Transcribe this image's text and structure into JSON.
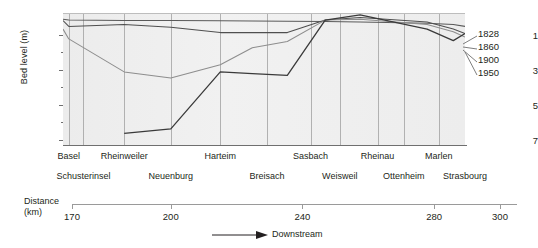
{
  "chart_data": {
    "type": "line",
    "title": "",
    "subtitle": "",
    "xlabel": "Distance (km)",
    "ylabel": "Bed level (m)",
    "y_ticks": [
      1,
      3,
      5,
      7
    ],
    "y_tick_labels": [
      "1",
      "3",
      "5",
      "7"
    ],
    "ylim": [
      0.2,
      7.6
    ],
    "y_inverted": true,
    "xlim": [
      163,
      301
    ],
    "x_ticks": [
      170,
      200,
      240,
      280,
      300
    ],
    "x_tick_labels": [
      "170",
      "200",
      "240",
      "280",
      "300"
    ],
    "grid": "vertical",
    "legend_position": "right",
    "direction_note": "Downstream",
    "series": [
      {
        "name": "1828",
        "color": "#5a5a5a",
        "x": [
          163,
          165,
          184,
          200,
          217,
          228,
          240,
          253,
          265,
          288,
          297,
          301
        ],
        "values": [
          0.55,
          0.6,
          0.62,
          0.62,
          0.64,
          0.65,
          0.66,
          0.68,
          0.7,
          0.78,
          0.85,
          0.95
        ]
      },
      {
        "name": "1860",
        "color": "#4f4f4f",
        "x": [
          163,
          165,
          184,
          200,
          217,
          228,
          240,
          253,
          265,
          288,
          297,
          301
        ],
        "values": [
          0.62,
          0.95,
          0.85,
          1.0,
          1.3,
          1.3,
          1.3,
          0.6,
          0.45,
          0.7,
          1.1,
          1.35
        ]
      },
      {
        "name": "1900",
        "color": "#8d8d8d",
        "x": [
          163,
          165,
          184,
          200,
          217,
          228,
          240,
          253,
          265,
          288,
          297,
          301
        ],
        "values": [
          1.1,
          1.65,
          3.5,
          3.85,
          3.1,
          2.15,
          1.8,
          0.6,
          0.55,
          0.85,
          1.25,
          1.55
        ]
      },
      {
        "name": "1950",
        "color": "#3a3a3a",
        "x": [
          184,
          200,
          217,
          228,
          240,
          253,
          265,
          288,
          297,
          301
        ],
        "values": [
          6.95,
          6.7,
          3.5,
          3.6,
          3.7,
          0.6,
          0.3,
          1.1,
          1.75,
          1.35
        ]
      }
    ],
    "places_upper": [
      {
        "label": "Basel",
        "x": 165
      },
      {
        "label": "Rheinweiler",
        "x": 184
      },
      {
        "label": "Harteim",
        "x": 217
      },
      {
        "label": "Sasbach",
        "x": 248
      },
      {
        "label": "Rheinau",
        "x": 271
      },
      {
        "label": "Marlen",
        "x": 292
      }
    ],
    "places_lower": [
      {
        "label": "Schusterinsel",
        "x": 170
      },
      {
        "label": "Neuenburg",
        "x": 200
      },
      {
        "label": "Breisach",
        "x": 233
      },
      {
        "label": "Weisweil",
        "x": 258
      },
      {
        "label": "Ottenheim",
        "x": 280
      },
      {
        "label": "Strasbourg",
        "x": 301
      }
    ]
  },
  "axis": {
    "y_title": "Bed level (m)",
    "y_labels": [
      "1",
      "3",
      "5",
      "7"
    ],
    "distance_line1": "Distance",
    "distance_line2": "(km)",
    "distance_labels": [
      "170",
      "200",
      "240",
      "280",
      "300"
    ]
  },
  "legend": {
    "items": [
      {
        "label": "1828"
      },
      {
        "label": "1860"
      },
      {
        "label": "1900"
      },
      {
        "label": "1950"
      }
    ]
  },
  "footer": {
    "downstream": "Downstream"
  }
}
